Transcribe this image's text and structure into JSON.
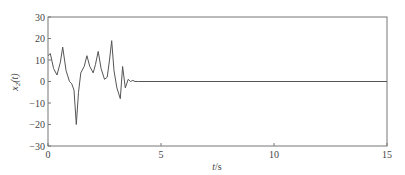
{
  "chart_data": {
    "type": "line",
    "title": "",
    "xlabel": "t/s",
    "ylabel": "x2(t)",
    "xlim": [
      0,
      15
    ],
    "ylim": [
      -30,
      30
    ],
    "xticks": [
      0,
      5,
      10,
      15
    ],
    "yticks": [
      30,
      20,
      10,
      0,
      -10,
      -20,
      -30
    ],
    "xtick_labels": [
      "0",
      "5",
      "10",
      "15"
    ],
    "ytick_labels": [
      "30",
      "20",
      "10",
      "0",
      "−10",
      "−20",
      "−30"
    ],
    "grid": false,
    "legend": null,
    "line_color": "#555555",
    "series": [
      {
        "name": "x2(t)",
        "x": [
          0,
          0.1,
          0.25,
          0.4,
          0.55,
          0.65,
          0.8,
          0.95,
          1.05,
          1.15,
          1.25,
          1.35,
          1.45,
          1.6,
          1.72,
          1.85,
          2.0,
          2.1,
          2.22,
          2.35,
          2.5,
          2.62,
          2.72,
          2.82,
          2.92,
          3.05,
          3.2,
          3.3,
          3.42,
          3.55,
          3.65,
          3.75,
          3.85,
          4.0,
          5,
          10,
          15
        ],
        "y": [
          12,
          13,
          6,
          3,
          9,
          16,
          5,
          0,
          -1,
          -4,
          -20,
          -5,
          4,
          7,
          12,
          7,
          4,
          8,
          14,
          6,
          1,
          2,
          10,
          19,
          5,
          -3,
          -8,
          7,
          -3,
          1,
          0,
          0.5,
          0,
          0,
          0,
          0,
          0
        ]
      }
    ]
  },
  "labels": {
    "xlabel_italic": "t",
    "xlabel_unit": "/s",
    "ylabel_main": "x",
    "ylabel_sub": "2",
    "ylabel_arg": "(t)"
  }
}
